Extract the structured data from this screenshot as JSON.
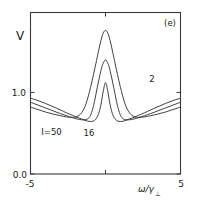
{
  "chart_data": {
    "type": "line",
    "title": "",
    "panel_label": "(e)",
    "xlabel": "ω/γ⊥",
    "xlabel_main": "ω/γ",
    "xlabel_sub": "⊥",
    "ylabel": "V",
    "xlim": [
      -5,
      5
    ],
    "ylim": [
      0.0,
      1.98
    ],
    "grid": false,
    "legend_position": "inline-annotations",
    "xticks": [
      -5,
      5
    ],
    "xticklabels": [
      "-5",
      "5"
    ],
    "yticks": [
      0.0,
      1.0
    ],
    "yticklabels": [
      "0.0",
      "1.0"
    ],
    "series": [
      {
        "name": "I=50",
        "label": "I=50",
        "label_x": -3.6,
        "label_y": 0.48,
        "peak_value": 1.76,
        "edge_value": 0.82,
        "x": [
          -5.0,
          -4.5,
          -4.0,
          -3.5,
          -3.0,
          -2.6,
          -2.2,
          -1.9,
          -1.6,
          -1.3,
          -1.0,
          -0.8,
          -0.6,
          -0.45,
          -0.3,
          -0.15,
          0.0,
          0.15,
          0.3,
          0.45,
          0.6,
          0.8,
          1.0,
          1.3,
          1.6,
          1.9,
          2.2,
          2.6,
          3.0,
          3.5,
          4.0,
          4.5,
          5.0
        ],
        "y": [
          0.82,
          0.79,
          0.76,
          0.735,
          0.715,
          0.7,
          0.695,
          0.705,
          0.75,
          0.86,
          1.06,
          1.22,
          1.39,
          1.52,
          1.64,
          1.73,
          1.76,
          1.73,
          1.64,
          1.52,
          1.39,
          1.22,
          1.06,
          0.86,
          0.75,
          0.705,
          0.695,
          0.7,
          0.715,
          0.735,
          0.76,
          0.79,
          0.82
        ]
      },
      {
        "name": "16",
        "label": "16",
        "label_x": -1.1,
        "label_y": 0.47,
        "peak_value": 1.4,
        "edge_value": 0.88,
        "x": [
          -5.0,
          -4.5,
          -4.0,
          -3.5,
          -3.0,
          -2.6,
          -2.2,
          -1.9,
          -1.6,
          -1.35,
          -1.15,
          -1.0,
          -0.85,
          -0.7,
          -0.55,
          -0.4,
          -0.25,
          -0.12,
          0.0,
          0.12,
          0.25,
          0.4,
          0.55,
          0.7,
          0.85,
          1.0,
          1.15,
          1.35,
          1.6,
          1.9,
          2.2,
          2.6,
          3.0,
          3.5,
          4.0,
          4.5,
          5.0
        ],
        "y": [
          0.88,
          0.845,
          0.81,
          0.775,
          0.74,
          0.715,
          0.69,
          0.675,
          0.665,
          0.665,
          0.68,
          0.72,
          0.8,
          0.92,
          1.06,
          1.19,
          1.31,
          1.37,
          1.4,
          1.37,
          1.31,
          1.19,
          1.06,
          0.92,
          0.8,
          0.72,
          0.68,
          0.665,
          0.665,
          0.675,
          0.69,
          0.715,
          0.74,
          0.775,
          0.81,
          0.845,
          0.88
        ]
      },
      {
        "name": "2",
        "label": "2",
        "label_x": 3.1,
        "label_y": 1.13,
        "peak_value": 1.12,
        "edge_value": 0.93,
        "x": [
          -5.0,
          -4.5,
          -4.0,
          -3.5,
          -3.0,
          -2.6,
          -2.2,
          -1.9,
          -1.6,
          -1.3,
          -1.1,
          -0.9,
          -0.75,
          -0.6,
          -0.45,
          -0.3,
          -0.15,
          0.0,
          0.15,
          0.3,
          0.45,
          0.6,
          0.75,
          0.9,
          1.1,
          1.3,
          1.6,
          1.9,
          2.2,
          2.6,
          3.0,
          3.5,
          4.0,
          4.5,
          5.0
        ],
        "y": [
          0.93,
          0.9,
          0.865,
          0.825,
          0.785,
          0.75,
          0.72,
          0.695,
          0.675,
          0.655,
          0.645,
          0.645,
          0.655,
          0.685,
          0.745,
          0.855,
          1.015,
          1.12,
          1.015,
          0.855,
          0.745,
          0.685,
          0.655,
          0.645,
          0.645,
          0.655,
          0.675,
          0.695,
          0.72,
          0.75,
          0.785,
          0.825,
          0.865,
          0.9,
          0.93
        ]
      }
    ]
  },
  "colors": {
    "curve": "#2b2b2b",
    "frame": "#3a3a3a",
    "text": "#1a1a1a",
    "background": "#ffffff"
  }
}
